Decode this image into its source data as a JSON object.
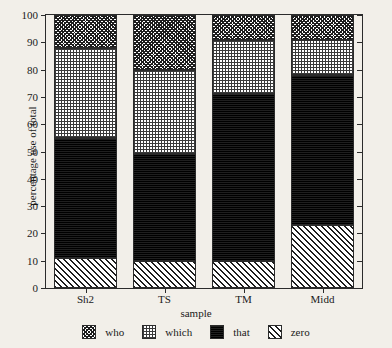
{
  "chart_data": {
    "type": "bar",
    "subtype": "stacked-bar-100",
    "title": "",
    "xlabel": "sample",
    "ylabel": "percentage use of total",
    "categories": [
      "Sh2",
      "TS",
      "TM",
      "Midd"
    ],
    "ylim": [
      0,
      100
    ],
    "yticks": [
      0,
      10,
      20,
      30,
      40,
      50,
      60,
      70,
      80,
      90,
      100
    ],
    "ytick_labels": [
      "0",
      "10",
      "20",
      "30",
      "40",
      "50",
      "60",
      "70",
      "80",
      "90",
      "100"
    ],
    "grid": false,
    "legend_position": "bottom",
    "stack_order_bottom_to_top": [
      "zero",
      "that",
      "which",
      "who"
    ],
    "series": [
      {
        "name": "who",
        "pattern": "dense-cross-hatch",
        "values": [
          12,
          20,
          9,
          9
        ]
      },
      {
        "name": "which",
        "pattern": "light-checker",
        "values": [
          33,
          31,
          20,
          13
        ]
      },
      {
        "name": "that",
        "pattern": "solid-black",
        "values": [
          44,
          39,
          61,
          55
        ]
      },
      {
        "name": "zero",
        "pattern": "diagonal-hatch",
        "values": [
          11,
          10,
          10,
          23
        ]
      }
    ],
    "cumulative_boundaries": {
      "Sh2": {
        "zero_top": 11,
        "that_top": 55,
        "which_top": 88,
        "who_top": 100
      },
      "TS": {
        "zero_top": 10,
        "that_top": 49,
        "which_top": 80,
        "who_top": 100
      },
      "TM": {
        "zero_top": 10,
        "that_top": 71,
        "which_top": 91,
        "who_top": 100
      },
      "Midd": {
        "zero_top": 23,
        "that_top": 78,
        "which_top": 91,
        "who_top": 100
      }
    }
  },
  "legend": {
    "items": [
      {
        "label": "who"
      },
      {
        "label": "which"
      },
      {
        "label": "that"
      },
      {
        "label": "zero"
      }
    ]
  },
  "colors": {
    "background": "#f2efe9",
    "axis": "#2b2b2b",
    "ink": "#1a1a1a",
    "solid_fill": "#141414"
  }
}
